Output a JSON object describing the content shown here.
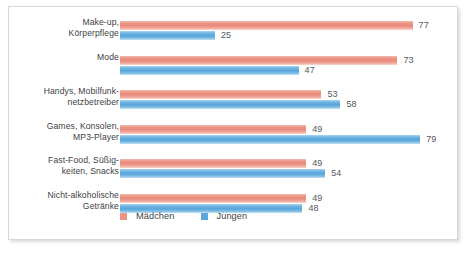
{
  "chart_data": {
    "type": "bar",
    "orientation": "horizontal",
    "title": "",
    "subtitle": "",
    "xlabel": "",
    "ylabel": "",
    "grid": false,
    "legend_position": "bottom-left",
    "xlim": [
      0,
      90
    ],
    "categories": [
      "Make-up,\nKörperpflege",
      "Mode",
      "Handys, Mobilfunk-\nnetzbetreiber",
      "Games, Konsolen,\nMP3-Player",
      "Fast-Food, Süßig-\nkeiten, Snacks",
      "Nicht-alkoholische\nGetränke"
    ],
    "series": [
      {
        "name": "Mädchen",
        "color": "#e8897b",
        "values": [
          77,
          73,
          53,
          49,
          49,
          49
        ]
      },
      {
        "name": "Jungen",
        "color": "#5ba7dc",
        "values": [
          25,
          47,
          58,
          79,
          54,
          48
        ]
      }
    ],
    "value_labels": {
      "Mädchen": [
        "77",
        "73",
        "53",
        "49",
        "49",
        "49"
      ],
      "Jungen": [
        "25",
        "47",
        "58",
        "79",
        "54",
        "48"
      ]
    }
  },
  "legend": {
    "items": [
      {
        "label": "Mädchen",
        "color": "#e8897b"
      },
      {
        "label": "Jungen",
        "color": "#5ba7dc"
      }
    ]
  },
  "style": {
    "frame_border": "#d5d7d8",
    "background": "#ffffff",
    "label_color": "#3d4143",
    "value_color": "#53585b"
  }
}
